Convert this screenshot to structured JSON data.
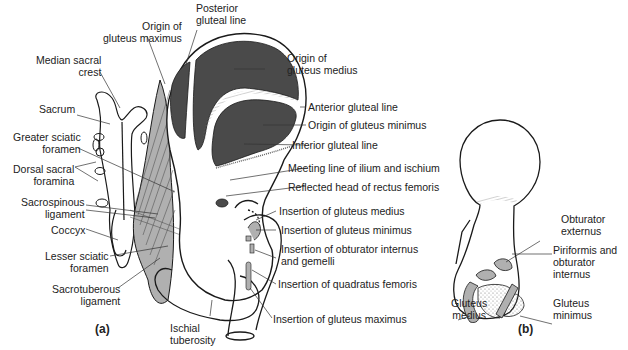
{
  "figure": {
    "panel_a": "(a)",
    "panel_b": "(b)",
    "colors": {
      "dark_muscle_area": "#4a4a4a",
      "ligament_gray": "#b0b0b0",
      "outline": "#1a1a1a",
      "label_text": "#222222"
    },
    "labels_a_left": [
      {
        "line1": "Origin of",
        "line2": "gluteus maximus"
      },
      {
        "line1": "Median sacral",
        "line2": "crest"
      },
      {
        "line1": "Sacrum",
        "line2": ""
      },
      {
        "line1": "Greater sciatic",
        "line2": "foramen"
      },
      {
        "line1": "Dorsal sacral",
        "line2": "foramina"
      },
      {
        "line1": "Sacrospinous",
        "line2": "ligament"
      },
      {
        "line1": "Coccyx",
        "line2": ""
      },
      {
        "line1": "Lesser sciatic",
        "line2": "foramen"
      },
      {
        "line1": "Sacrotuberous",
        "line2": "ligament"
      }
    ],
    "labels_a_top": [
      {
        "line1": "Posterior",
        "line2": "gluteal line"
      }
    ],
    "labels_a_right": [
      {
        "line1": "Origin of",
        "line2": "gluteus medius"
      },
      {
        "line1": "Anterior gluteal line",
        "line2": ""
      },
      {
        "line1": "Origin of gluteus minimus",
        "line2": ""
      },
      {
        "line1": "Inferior gluteal line",
        "line2": ""
      },
      {
        "line1": "Meeting line of ilium and ischium",
        "line2": ""
      },
      {
        "line1": "Reflected head of rectus femoris",
        "line2": ""
      },
      {
        "line1": "Insertion of gluteus medius",
        "line2": ""
      },
      {
        "line1": "Insertion of gluteus minimus",
        "line2": ""
      },
      {
        "line1": "Insertion of obturator internus",
        "line2": "and gemelli"
      },
      {
        "line1": "Insertion of quadratus femoris",
        "line2": ""
      },
      {
        "line1": "Insertion of gluteus maximus",
        "line2": ""
      }
    ],
    "labels_a_bottom": [
      {
        "line1": "Ischial",
        "line2": "tuberosity"
      }
    ],
    "labels_b": [
      {
        "line1": "Obturator",
        "line2": "externus"
      },
      {
        "line1": "Piriformis and",
        "line2": "obturator",
        "line3": "internus"
      },
      {
        "line1": "Gluteus",
        "line2": "medius"
      },
      {
        "line1": "Gluteus",
        "line2": "minimus"
      }
    ]
  }
}
